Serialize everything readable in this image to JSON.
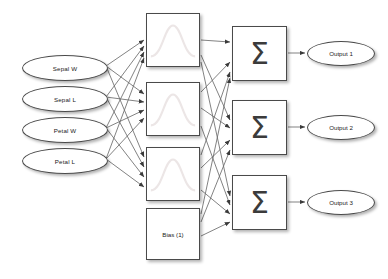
{
  "diagram": {
    "background_color": "#ffffff",
    "stroke_color": "#4a4a4a",
    "curve_color": "#e9e3e3",
    "layers": {
      "input": {
        "name": "input-layer",
        "shape": "ellipse",
        "nodes": [
          {
            "id": "in-sepal-w",
            "label": "Sepal W",
            "x": 22,
            "y": 55,
            "w": 86,
            "h": 26
          },
          {
            "id": "in-sepal-l",
            "label": "Sepal L",
            "x": 22,
            "y": 86,
            "w": 86,
            "h": 26
          },
          {
            "id": "in-petal-w",
            "label": "Petal W",
            "x": 22,
            "y": 117,
            "w": 86,
            "h": 26
          },
          {
            "id": "in-petal-l",
            "label": "Petal L",
            "x": 22,
            "y": 148,
            "w": 86,
            "h": 26
          }
        ]
      },
      "hidden": {
        "name": "hidden-layer",
        "shape": "rect",
        "glyph": "gaussian-curve",
        "nodes": [
          {
            "id": "hid-1",
            "label": "",
            "x": 146,
            "y": 13,
            "w": 54,
            "h": 54
          },
          {
            "id": "hid-2",
            "label": "",
            "x": 146,
            "y": 82,
            "w": 54,
            "h": 54
          },
          {
            "id": "hid-3",
            "label": "",
            "x": 146,
            "y": 147,
            "w": 54,
            "h": 54
          }
        ]
      },
      "bias": {
        "name": "bias-node",
        "shape": "rect",
        "node": {
          "id": "bias-1",
          "label": "Bias (1)",
          "x": 146,
          "y": 208,
          "w": 54,
          "h": 52
        }
      },
      "summation": {
        "name": "summation-layer",
        "shape": "rect",
        "glyph": "sigma",
        "symbol": "Σ",
        "nodes": [
          {
            "id": "sum-1",
            "label": "Σ",
            "x": 232,
            "y": 26,
            "w": 55,
            "h": 55
          },
          {
            "id": "sum-2",
            "label": "Σ",
            "x": 232,
            "y": 100,
            "w": 55,
            "h": 55
          },
          {
            "id": "sum-3",
            "label": "Σ",
            "x": 232,
            "y": 175,
            "w": 55,
            "h": 55
          }
        ]
      },
      "output": {
        "name": "output-layer",
        "shape": "ellipse",
        "nodes": [
          {
            "id": "out-1",
            "label": "Output 1",
            "x": 307,
            "y": 41,
            "w": 68,
            "h": 25
          },
          {
            "id": "out-2",
            "label": "Output 2",
            "x": 307,
            "y": 115,
            "w": 68,
            "h": 25
          },
          {
            "id": "out-3",
            "label": "Output 3",
            "x": 307,
            "y": 190,
            "w": 68,
            "h": 25
          }
        ]
      }
    },
    "connections": {
      "input_to_hidden": "fully-connected",
      "hidden_to_summation": "fully-connected",
      "bias_to_summation": "fully-connected",
      "summation_to_output": "one-to-one"
    }
  }
}
